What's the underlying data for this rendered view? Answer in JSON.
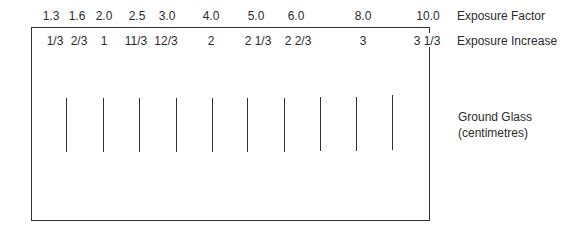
{
  "diagram": {
    "exposure_factor": {
      "label": "Exposure Factor",
      "values": [
        "1.3",
        "1.6",
        "2.0",
        "2.5",
        "3.0",
        "4.0",
        "5.0",
        "6.0",
        "8.0",
        "10.0"
      ]
    },
    "exposure_increase": {
      "label": "Exposure Increase",
      "values": [
        "1/3",
        "2/3",
        "1",
        "11/3",
        "12/3",
        "2",
        "2 1/3",
        "2 2/3",
        "3",
        "3 1/3"
      ]
    },
    "ground_glass": {
      "label_line1": "Ground Glass",
      "label_line2": "(centimetres)",
      "line_count": 10
    }
  }
}
